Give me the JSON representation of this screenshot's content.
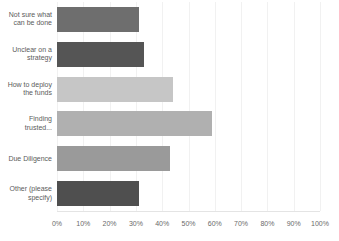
{
  "chart_data": {
    "type": "bar",
    "orientation": "horizontal",
    "title": "",
    "xlabel": "",
    "ylabel": "",
    "xlim": [
      0,
      100
    ],
    "grid": true,
    "legend": "none",
    "tick_labels": [
      "0%",
      "10%",
      "20%",
      "30%",
      "40%",
      "50%",
      "60%",
      "70%",
      "80%",
      "90%",
      "100%"
    ],
    "tick_values": [
      0,
      10,
      20,
      30,
      40,
      50,
      60,
      70,
      80,
      90,
      100
    ],
    "categories": [
      "Not sure what\ncan be done",
      "Unclear on a\nstrategy",
      "How to deploy\nthe funds",
      "Finding\ntrusted...",
      "Due Diligence",
      "Other (please\nspecify)"
    ],
    "values": [
      31,
      33,
      44,
      59,
      43,
      31
    ],
    "value_labels": [
      "31%",
      "33%",
      "44%",
      "59%",
      "43%",
      "31%"
    ],
    "bar_colors": [
      "#6e6e6e",
      "#555555",
      "#c6c6c6",
      "#b0b0b0",
      "#9a9a9a",
      "#4f4f4f"
    ]
  },
  "style": {
    "background": "#ffffff",
    "text_color": "#5b5b5b",
    "gridline_color": "#f1f1f1",
    "axis_color": "#e4e4e4"
  }
}
